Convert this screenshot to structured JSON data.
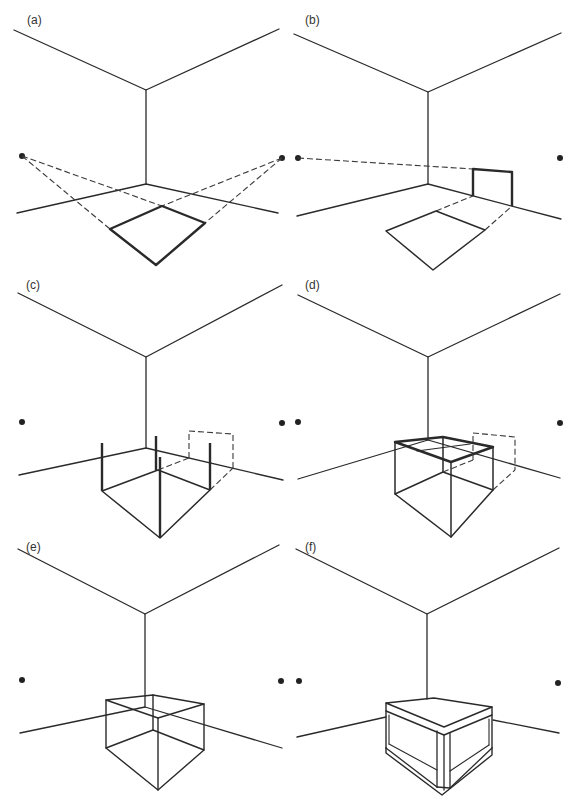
{
  "figure": {
    "ink_color": "#2a2a2a",
    "background": "#ffffff",
    "panels": [
      {
        "label": "(a)",
        "step": "Vanishing points and floor square projected to corner"
      },
      {
        "label": "(b)",
        "step": "Height measured on wall and projected"
      },
      {
        "label": "(c)",
        "step": "Vertical posts raised at square corners"
      },
      {
        "label": "(d)",
        "step": "Top face constructed"
      },
      {
        "label": "(e)",
        "step": "Wireframe box"
      },
      {
        "label": "(f)",
        "step": "Finished box with thickness"
      }
    ]
  }
}
